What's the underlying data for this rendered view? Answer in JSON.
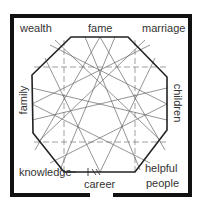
{
  "diagram": {
    "type": "bagua-map",
    "colors": {
      "frame": "#111111",
      "octagon": "#222222",
      "star_lines": "#666666",
      "text": "#333333",
      "background": "#ffffff"
    },
    "areas": {
      "top_left": "wealth",
      "top_center": "fame",
      "top_right": "marriage",
      "middle_left": "family",
      "middle_right": "children",
      "bottom_left": "knowledge",
      "bottom_center": "career",
      "bottom_right_line1": "helpful",
      "bottom_right_line2": "people"
    }
  }
}
